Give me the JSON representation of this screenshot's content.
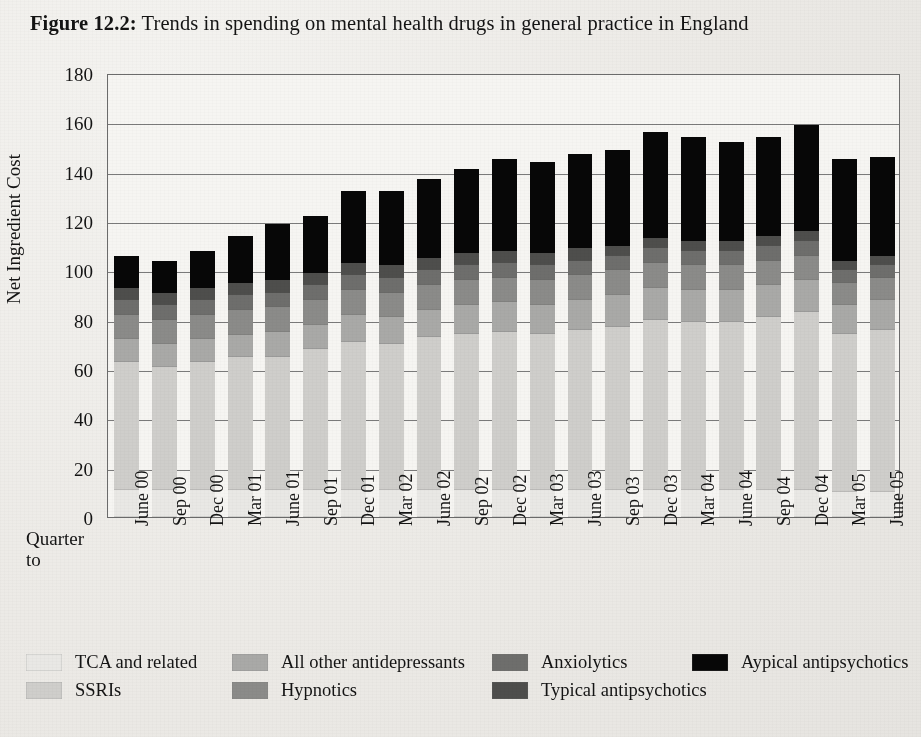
{
  "figure": {
    "label": "Figure 12.2:",
    "title": "Trends in spending on mental health drugs in general practice in England"
  },
  "axis": {
    "quarter_label_line1": "Quarter",
    "quarter_label_line2": "to"
  },
  "legend": {
    "rows": [
      [
        {
          "name": "tca-and-related",
          "label": "TCA and related",
          "color": "#e9e8e5"
        },
        {
          "name": "all-other-antidepressants",
          "label": "All other antidepressants",
          "color": "#a9a9a7"
        },
        {
          "name": "anxiolytics",
          "label": "Anxiolytics",
          "color": "#6e6e6c"
        },
        {
          "name": "atypical-antipsychotics",
          "label": "Aypical antipsychotics",
          "color": "#070707"
        }
      ],
      [
        {
          "name": "ssris",
          "label": "SSRIs",
          "color": "#cfcecb"
        },
        {
          "name": "hypnotics",
          "label": "Hypnotics",
          "color": "#8b8b89"
        },
        {
          "name": "typical-antipsychotics",
          "label": "Typical antipsychotics",
          "color": "#4e4e4c"
        }
      ]
    ]
  },
  "chart_data": {
    "type": "bar",
    "subtype": "stacked-vertical",
    "title": "Trends in spending on mental health drugs in general practice in England",
    "xlabel": "Quarter to",
    "ylabel": "Net Ingredient Cost",
    "ylim": [
      0,
      180
    ],
    "yticks": [
      0,
      20,
      40,
      60,
      80,
      100,
      120,
      140,
      160,
      180
    ],
    "grid": true,
    "grid_axis": "y",
    "legend_position": "bottom",
    "categories": [
      "June 00",
      "Sep 00",
      "Dec 00",
      "Mar 01",
      "June 01",
      "Sep 01",
      "Dec 01",
      "Mar 02",
      "June 02",
      "Sep 02",
      "Dec 02",
      "Mar 03",
      "June 03",
      "Sep 03",
      "Dec 03",
      "Mar 04",
      "June 04",
      "Sep 04",
      "Dec 04",
      "Mar 05",
      "June 05"
    ],
    "series": [
      {
        "name": "TCA and related",
        "color": "#e9e8e5",
        "values": [
          11,
          11,
          11,
          11,
          11,
          11,
          11,
          11,
          11,
          11,
          11,
          11,
          11,
          11,
          11,
          11,
          11,
          11,
          11,
          10,
          10
        ]
      },
      {
        "name": "SSRIs",
        "color": "#cfcecb",
        "values": [
          52,
          50,
          52,
          54,
          54,
          57,
          60,
          59,
          62,
          63,
          64,
          63,
          65,
          66,
          69,
          68,
          68,
          70,
          72,
          64,
          66
        ]
      },
      {
        "name": "All other antidepressants",
        "color": "#a9a9a7",
        "values": [
          9,
          9,
          9,
          9,
          10,
          10,
          11,
          11,
          11,
          12,
          12,
          12,
          12,
          13,
          13,
          13,
          13,
          13,
          13,
          12,
          12
        ]
      },
      {
        "name": "Hypnotics",
        "color": "#8b8b89",
        "values": [
          10,
          10,
          10,
          10,
          10,
          10,
          10,
          10,
          10,
          10,
          10,
          10,
          10,
          10,
          10,
          10,
          10,
          10,
          10,
          9,
          9
        ]
      },
      {
        "name": "Anxiolytics",
        "color": "#6e6e6c",
        "values": [
          6,
          6,
          6,
          6,
          6,
          6,
          6,
          6,
          6,
          6,
          6,
          6,
          6,
          6,
          6,
          6,
          6,
          6,
          6,
          5,
          5
        ]
      },
      {
        "name": "Typical antipsychotics",
        "color": "#4e4e4c",
        "values": [
          5,
          5,
          5,
          5,
          5,
          5,
          5,
          5,
          5,
          5,
          5,
          5,
          5,
          4,
          4,
          4,
          4,
          4,
          4,
          4,
          4
        ]
      },
      {
        "name": "Aypical antipsychotics",
        "color": "#070707",
        "values": [
          13,
          13,
          15,
          19,
          23,
          23,
          29,
          30,
          32,
          34,
          37,
          37,
          38,
          39,
          43,
          42,
          40,
          40,
          43,
          41,
          40
        ]
      }
    ],
    "totals": [
      106,
      104,
      108,
      114,
      119,
      122,
      132,
      132,
      137,
      141,
      145,
      144,
      147,
      149,
      156,
      154,
      152,
      154,
      159,
      145,
      146
    ]
  }
}
